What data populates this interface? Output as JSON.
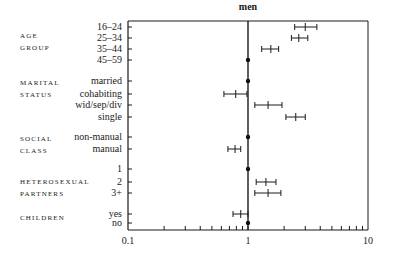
{
  "chart_data": {
    "type": "forest",
    "title": "men",
    "xscale": "log",
    "xlim": [
      0.1,
      10
    ],
    "xticks": [
      "0.1",
      "1",
      "10"
    ],
    "reference_line": 1,
    "xlabel": "",
    "ylabel": "",
    "groups": [
      {
        "label": "AGE\nGROUP",
        "rows": [
          {
            "label": "16–24",
            "or": 3.0,
            "lo": 2.45,
            "hi": 3.75
          },
          {
            "label": "25–34",
            "or": 2.65,
            "lo": 2.3,
            "hi": 3.15
          },
          {
            "label": "35–44",
            "or": 1.55,
            "lo": 1.3,
            "hi": 1.8
          },
          {
            "label": "45–59",
            "or": 1.0,
            "lo": null,
            "hi": null
          }
        ]
      },
      {
        "label": "MARITAL\nSTATUS",
        "rows": [
          {
            "label": "married",
            "or": 1.0,
            "lo": null,
            "hi": null
          },
          {
            "label": "cohabiting",
            "or": 0.79,
            "lo": 0.63,
            "hi": 0.98
          },
          {
            "label": "wid/sep/div",
            "or": 1.47,
            "lo": 1.14,
            "hi": 1.92
          },
          {
            "label": "single",
            "or": 2.5,
            "lo": 2.07,
            "hi": 3.0
          }
        ]
      },
      {
        "label": "SOCIAL\nCLASS",
        "rows": [
          {
            "label": "non-manual",
            "or": 1.0,
            "lo": null,
            "hi": null
          },
          {
            "label": "manual",
            "or": 0.78,
            "lo": 0.68,
            "hi": 0.87
          }
        ]
      },
      {
        "label": "HETEROSEXUAL\nPARTNERS",
        "rows": [
          {
            "label": "1",
            "or": 1.0,
            "lo": null,
            "hi": null
          },
          {
            "label": "2",
            "or": 1.41,
            "lo": 1.17,
            "hi": 1.71
          },
          {
            "label": "3+",
            "or": 1.47,
            "lo": 1.14,
            "hi": 1.88
          }
        ]
      },
      {
        "label": "CHILDREN",
        "rows": [
          {
            "label": "yes",
            "or": 0.87,
            "lo": 0.75,
            "hi": 1.0
          },
          {
            "label": "no",
            "or": 1.0,
            "lo": null,
            "hi": null
          }
        ]
      }
    ]
  }
}
